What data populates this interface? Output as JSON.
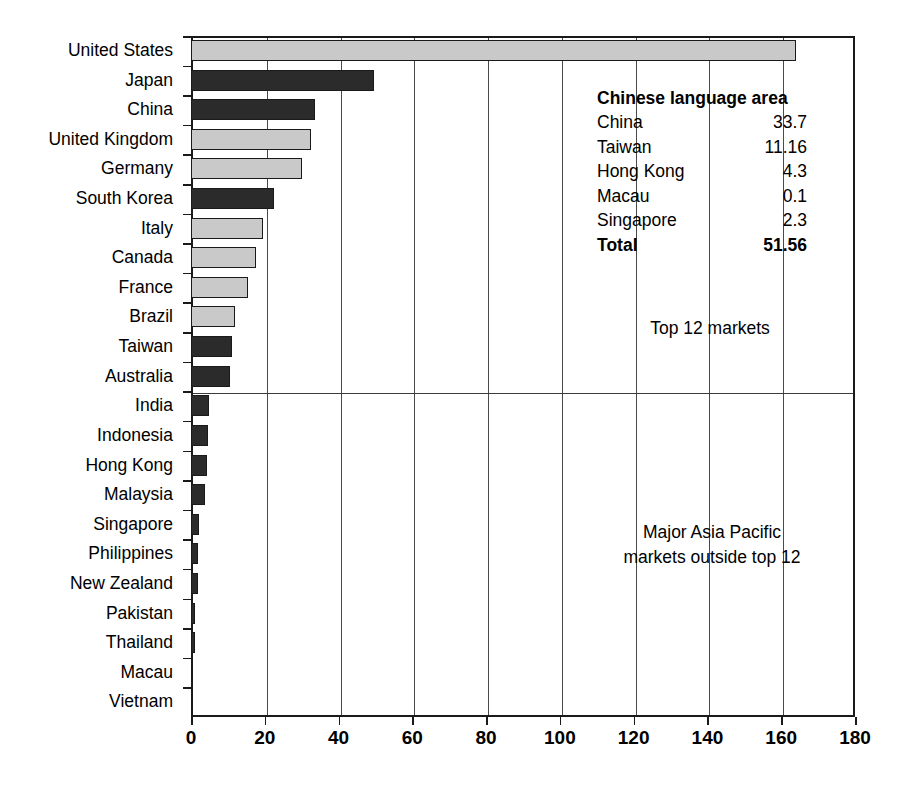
{
  "chart_data": {
    "type": "bar",
    "orientation": "horizontal",
    "title": "",
    "xlabel": "",
    "ylabel": "",
    "xlim": [
      0,
      180
    ],
    "xticks": [
      0,
      20,
      40,
      60,
      80,
      100,
      120,
      140,
      160,
      180
    ],
    "grid": "vertical gridlines at every x tick",
    "legend": "none",
    "categories": [
      "United States",
      "Japan",
      "China",
      "United Kingdom",
      "Germany",
      "South Korea",
      "Italy",
      "Canada",
      "France",
      "Brazil",
      "Taiwan",
      "Australia",
      "India",
      "Indonesia",
      "Hong Kong",
      "Malaysia",
      "Singapore",
      "Philippines",
      "New Zealand",
      "Pakistan",
      "Thailand",
      "Macau",
      "Vietnam"
    ],
    "values": [
      164.0,
      49.5,
      33.7,
      32.5,
      30.0,
      22.5,
      19.5,
      17.5,
      15.5,
      12.0,
      11.16,
      10.5,
      5.0,
      4.5,
      4.3,
      3.8,
      2.3,
      2.0,
      2.0,
      1.0,
      1.0,
      0.3,
      0.3
    ],
    "bar_styles": [
      "light",
      "dark",
      "dark",
      "light",
      "light",
      "dark",
      "light",
      "light",
      "light",
      "light",
      "dark",
      "dark",
      "dark",
      "dark",
      "dark",
      "dark",
      "dark",
      "dark",
      "dark",
      "dark",
      "dark",
      "dark",
      "dark"
    ],
    "group_divider_after_category": "Australia",
    "annotations": [
      "Top 12 markets",
      "Major Asia Pacific\nmarkets outside top 12"
    ],
    "colors": {
      "light_bar": "#c9c9c9",
      "dark_bar": "#2b2b2b",
      "axis": "#1a1a1a",
      "gridline": "#4a4a4a",
      "background": "#ffffff"
    }
  },
  "annotations": {
    "top12": "Top 12 markets",
    "apac": "Major Asia Pacific\nmarkets outside top 12"
  },
  "inset": {
    "title": "Chinese language area",
    "rows": [
      {
        "label": "China",
        "value": "33.7"
      },
      {
        "label": "Taiwan",
        "value": "11.16"
      },
      {
        "label": "Hong Kong",
        "value": "4.3"
      },
      {
        "label": "Macau",
        "value": "0.1"
      },
      {
        "label": "Singapore",
        "value": "2.3"
      }
    ],
    "total": {
      "label": "Total",
      "value": "51.56"
    }
  }
}
